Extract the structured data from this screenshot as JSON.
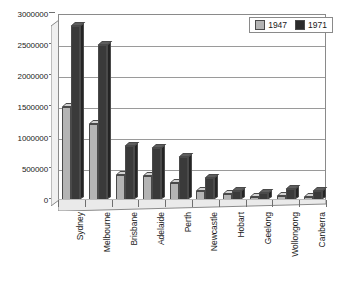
{
  "chart_data": {
    "type": "bar",
    "title": "",
    "subtitle": "",
    "xlabel": "",
    "ylabel": "",
    "ylim": [
      0,
      3000000
    ],
    "ytick_labels": [
      "0",
      "500000",
      "1000000",
      "1500000",
      "2000000",
      "2500000",
      "3000000"
    ],
    "ytick_values": [
      0,
      500000,
      1000000,
      1500000,
      2000000,
      2500000,
      3000000
    ],
    "grid": true,
    "legend_position": "top-right",
    "categories": [
      "Sydney",
      "Melbourne",
      "Brisbane",
      "Adelaide",
      "Perth",
      "Newcastle",
      "Hobart",
      "Geelong",
      "Wollongong",
      "Canberra"
    ],
    "series": [
      {
        "name": "1947",
        "color": "#b4b4b4",
        "values": [
          1500000,
          1230000,
          400000,
          390000,
          280000,
          150000,
          95000,
          55000,
          60000,
          45000
        ]
      },
      {
        "name": "1971",
        "color": "#2b2b2b",
        "values": [
          2800000,
          2500000,
          870000,
          840000,
          690000,
          360000,
          150000,
          115000,
          185000,
          140000
        ]
      }
    ]
  },
  "legend": {
    "items": [
      {
        "label": "1947",
        "swatch": "#b4b4b4"
      },
      {
        "label": "1971",
        "swatch": "#2b2b2b"
      }
    ]
  }
}
